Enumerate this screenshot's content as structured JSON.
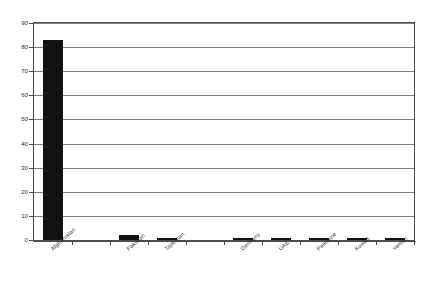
{
  "chart_data": {
    "type": "bar",
    "title": "",
    "xlabel": "",
    "ylabel": "",
    "ylim": [
      0,
      90
    ],
    "ytick_step": 10,
    "yticks": [
      0,
      10,
      20,
      30,
      40,
      50,
      60,
      70,
      80,
      90
    ],
    "grid": true,
    "legend": false,
    "bar_color": "#111111",
    "categories": [
      "Afghanistan",
      "Pakistan",
      "Tajikistan",
      "Germany",
      "UAE",
      "Palestine",
      "Kuwait",
      "Yemen"
    ],
    "values": [
      83,
      2,
      1,
      1,
      1,
      1,
      1,
      1
    ],
    "slot_count": 10,
    "slots": [
      {
        "index": 0,
        "label": "Afghanistan",
        "value": 83
      },
      {
        "index": 1,
        "label": "",
        "value": null
      },
      {
        "index": 2,
        "label": "Pakistan",
        "value": 2
      },
      {
        "index": 3,
        "label": "Tajikistan",
        "value": 1
      },
      {
        "index": 4,
        "label": "",
        "value": null
      },
      {
        "index": 5,
        "label": "Germany",
        "value": 1
      },
      {
        "index": 6,
        "label": "UAE",
        "value": 1
      },
      {
        "index": 7,
        "label": "Palestine",
        "value": 1
      },
      {
        "index": 8,
        "label": "Kuwait",
        "value": 1
      },
      {
        "index": 9,
        "label": "Yemen",
        "value": 1
      }
    ]
  }
}
